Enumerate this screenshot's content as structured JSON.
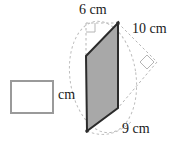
{
  "figure": {
    "type": "parallelogram-with-height-and-diagonal",
    "shape_fill": "#a8a8a8",
    "shape_stroke": "#2b2b2b",
    "dashed_stroke": "#b0b0b0",
    "box_border": "#9a9a9a",
    "labels": {
      "top": "6 cm",
      "slant": "10 cm",
      "bottom": "9 cm",
      "unit": "cm"
    },
    "answer": {
      "value": "",
      "placeholder": ""
    },
    "right_angle_markers": 2,
    "geometry": {
      "parallelogram": [
        [
          86,
          56
        ],
        [
          118,
          23
        ],
        [
          118,
          108
        ],
        [
          87,
          131
        ]
      ],
      "top_dashed_corner": [
        86,
        23
      ],
      "diagonal_apex": [
        157,
        62
      ]
    }
  }
}
